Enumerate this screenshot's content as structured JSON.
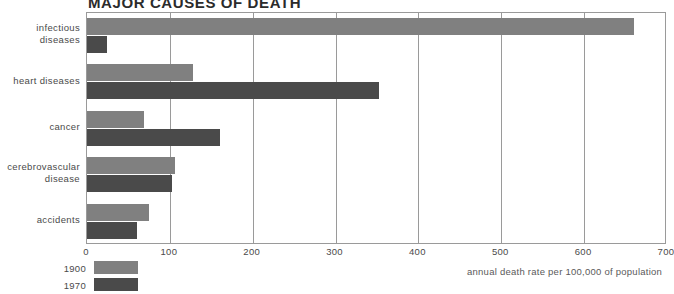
{
  "chart_data": {
    "type": "bar",
    "title": "MAJOR CAUSES OF DEATH",
    "orientation": "horizontal",
    "categories": [
      "infectious diseases",
      "heart diseases",
      "cancer",
      "cerebrovascular disease",
      "accidents"
    ],
    "category_lines": [
      [
        "infectious",
        "diseases"
      ],
      [
        "heart diseases"
      ],
      [
        "cancer"
      ],
      [
        "cerebrovascular",
        "disease"
      ],
      [
        "accidents"
      ]
    ],
    "series": [
      {
        "name": "1900",
        "color": "#808080",
        "values": [
          660,
          128,
          69,
          106,
          75
        ]
      },
      {
        "name": "1970",
        "color": "#4a4a4a",
        "values": [
          24,
          352,
          160,
          103,
          60
        ]
      }
    ],
    "xlabel": "annual death rate per 100,000 of population",
    "ylabel": "",
    "xlim": [
      0,
      700
    ],
    "xticks": [
      0,
      100,
      200,
      300,
      400,
      500,
      600,
      700
    ],
    "xtick_labels": [
      "0",
      "100",
      "200",
      "300",
      "400",
      "500",
      "600",
      "700"
    ],
    "grid": true,
    "grid_axis": "x",
    "legend_position": "bottom-left"
  },
  "legend": {
    "items": [
      {
        "label": "1900",
        "swatch": "1900"
      },
      {
        "label": "1970",
        "swatch": "1970"
      }
    ]
  },
  "footnote": {
    "text": "annual death rate per 100,000 of population"
  }
}
